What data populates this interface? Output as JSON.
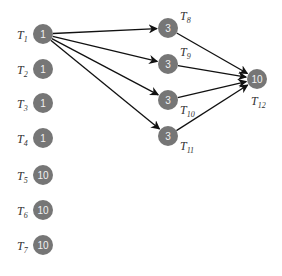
{
  "diagram": {
    "type": "task-dependency-graph",
    "nodes": [
      {
        "id": "T1",
        "label": "T",
        "sub": "1",
        "value": "1"
      },
      {
        "id": "T2",
        "label": "T",
        "sub": "2",
        "value": "1"
      },
      {
        "id": "T3",
        "label": "T",
        "sub": "3",
        "value": "1"
      },
      {
        "id": "T4",
        "label": "T",
        "sub": "4",
        "value": "1"
      },
      {
        "id": "T5",
        "label": "T",
        "sub": "5",
        "value": "10"
      },
      {
        "id": "T6",
        "label": "T",
        "sub": "6",
        "value": "10"
      },
      {
        "id": "T7",
        "label": "T",
        "sub": "7",
        "value": "10"
      },
      {
        "id": "T8",
        "label": "T",
        "sub": "8",
        "value": "3"
      },
      {
        "id": "T9",
        "label": "T",
        "sub": "9",
        "value": "3"
      },
      {
        "id": "T10",
        "label": "T",
        "sub": "10",
        "value": "3"
      },
      {
        "id": "T11",
        "label": "T",
        "sub": "11",
        "value": "3"
      },
      {
        "id": "T12",
        "label": "T",
        "sub": "12",
        "value": "10"
      }
    ],
    "edges": [
      {
        "from": "T1",
        "to": "T8"
      },
      {
        "from": "T1",
        "to": "T9"
      },
      {
        "from": "T1",
        "to": "T10"
      },
      {
        "from": "T1",
        "to": "T11"
      },
      {
        "from": "T8",
        "to": "T12"
      },
      {
        "from": "T9",
        "to": "T12"
      },
      {
        "from": "T10",
        "to": "T12"
      },
      {
        "from": "T11",
        "to": "T12"
      }
    ],
    "colors": {
      "node_fill": "#767676",
      "node_text": "#f2f2f2",
      "edge": "#111111",
      "label": "#333333"
    }
  }
}
